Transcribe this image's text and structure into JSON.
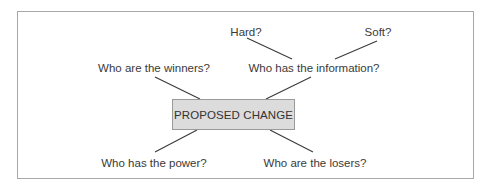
{
  "diagram": {
    "center": {
      "label": "PROPOSED CHANGE",
      "fill": "#dcdcdc",
      "border": "#9a9a9a"
    },
    "nodes": [
      {
        "id": "winners",
        "label": "Who are the winners?"
      },
      {
        "id": "information",
        "label": "Who has the information?"
      },
      {
        "id": "hard",
        "label": "Hard?"
      },
      {
        "id": "soft",
        "label": "Soft?"
      },
      {
        "id": "power",
        "label": "Who has the power?"
      },
      {
        "id": "losers",
        "label": "Who are the losers?"
      }
    ],
    "edges": [
      {
        "from": "PROPOSED CHANGE",
        "to": "Who are the winners?"
      },
      {
        "from": "PROPOSED CHANGE",
        "to": "Who has the information?"
      },
      {
        "from": "Who has the information?",
        "to": "Hard?"
      },
      {
        "from": "Who has the information?",
        "to": "Soft?"
      },
      {
        "from": "PROPOSED CHANGE",
        "to": "Who has the power?"
      },
      {
        "from": "PROPOSED CHANGE",
        "to": "Who are the losers?"
      }
    ],
    "line_color": "#3a3a3a",
    "frame_color": "#a8a8a8"
  }
}
